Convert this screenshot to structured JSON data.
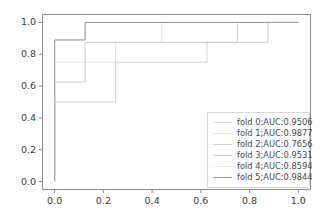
{
  "chart_data": {
    "type": "line",
    "title": "",
    "xlabel": "",
    "ylabel": "",
    "xlim": [
      -0.05,
      1.05
    ],
    "ylim": [
      -0.05,
      1.05
    ],
    "grid": false,
    "legend_position": "lower right",
    "xticks": [
      "0.0",
      "0.2",
      "0.4",
      "0.6",
      "0.8",
      "1.0"
    ],
    "xtick_values": [
      0.0,
      0.2,
      0.4,
      0.6,
      0.8,
      1.0
    ],
    "yticks": [
      "0.0",
      "0.2",
      "0.4",
      "0.6",
      "0.8",
      "1.0"
    ],
    "ytick_values": [
      0.0,
      0.2,
      0.4,
      0.6,
      0.8,
      1.0
    ],
    "series": [
      {
        "name": "fold 0;AUC:0.9506",
        "label": "fold 0;AUC:0.9506",
        "auc": 0.9506,
        "color": "#dcdcdc",
        "x": [
          0.0,
          0.0,
          0.0,
          0.125,
          0.125,
          1.0
        ],
        "y": [
          0.0,
          0.5,
          0.89,
          0.89,
          1.0,
          1.0
        ]
      },
      {
        "name": "fold 1;AUC:0.9877",
        "label": "fold 1;AUC:0.9877",
        "auc": 0.9877,
        "color": "#e4e4e4",
        "x": [
          0.0,
          0.0,
          0.25,
          0.25,
          0.44,
          0.44,
          1.0
        ],
        "y": [
          0.0,
          0.75,
          0.75,
          0.875,
          0.875,
          1.0,
          1.0
        ]
      },
      {
        "name": "fold 2;AUC:0.7656",
        "label": "fold 2;AUC:0.7656",
        "auc": 0.7656,
        "color": "#d2d2d2",
        "x": [
          0.0,
          0.0,
          0.25,
          0.25,
          0.625,
          0.625,
          0.75,
          0.75,
          1.0
        ],
        "y": [
          0.0,
          0.5,
          0.5,
          0.75,
          0.75,
          0.875,
          0.875,
          1.0,
          1.0
        ]
      },
      {
        "name": "fold 3;AUC:0.9531",
        "label": "fold 3;AUC:0.9531",
        "auc": 0.9531,
        "color": "#cccccc",
        "x": [
          0.0,
          0.0,
          0.125,
          0.125,
          0.875,
          0.875,
          1.0
        ],
        "y": [
          0.0,
          0.625,
          0.625,
          0.875,
          0.875,
          1.0,
          1.0
        ]
      },
      {
        "name": "fold 4;AUC:0.8594",
        "label": "fold 4;AUC:0.8594",
        "auc": 0.8594,
        "color": "#e8e8e8",
        "x": [
          0.0,
          0.0,
          0.125,
          0.125,
          1.0
        ],
        "y": [
          0.0,
          0.89,
          0.89,
          1.0,
          1.0
        ]
      },
      {
        "name": "fold 5;AUC:0.9844",
        "label": "fold 5;AUC:0.9844",
        "auc": 0.9844,
        "color": "#9a9a9a",
        "x": [
          0.0,
          0.0,
          0.125,
          0.125,
          1.0
        ],
        "y": [
          0.0,
          0.89,
          0.89,
          1.0,
          1.0
        ]
      }
    ]
  },
  "axes": {
    "spine_color": "#8d8d8d",
    "tick_color": "#8d8d8d",
    "background": "#ffffff"
  },
  "legend": {
    "border_color": "#d8d8d8",
    "background": "#ffffff"
  }
}
